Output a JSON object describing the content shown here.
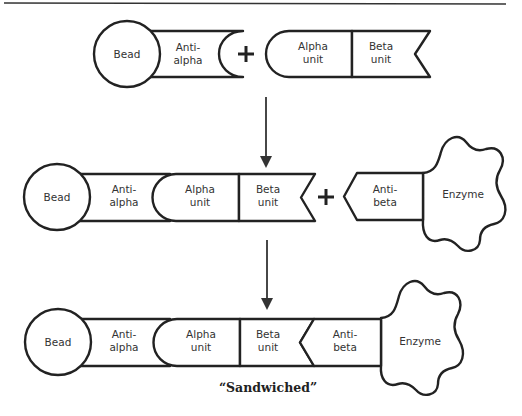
{
  "diagram": {
    "type": "sandwich-assay",
    "colors": {
      "stroke": "#222222",
      "background": "#ffffff",
      "text": "#333333"
    },
    "row1": {
      "bead": "Bead",
      "anti_alpha_1": "Anti-",
      "anti_alpha_2": "alpha",
      "operator": "+",
      "alpha_1": "Alpha",
      "alpha_2": "unit",
      "beta_1": "Beta",
      "beta_2": "unit"
    },
    "row2": {
      "bead": "Bead",
      "anti_alpha_1": "Anti-",
      "anti_alpha_2": "alpha",
      "alpha_1": "Alpha",
      "alpha_2": "unit",
      "beta_1": "Beta",
      "beta_2": "unit",
      "operator": "+",
      "anti_beta_1": "Anti-",
      "anti_beta_2": "beta",
      "enzyme": "Enzyme"
    },
    "row3": {
      "bead": "Bead",
      "anti_alpha_1": "Anti-",
      "anti_alpha_2": "alpha",
      "alpha_1": "Alpha",
      "alpha_2": "unit",
      "beta_1": "Beta",
      "beta_2": "unit",
      "anti_beta_1": "Anti-",
      "anti_beta_2": "beta",
      "enzyme": "Enzyme"
    },
    "caption": "“Sandwiched”"
  }
}
